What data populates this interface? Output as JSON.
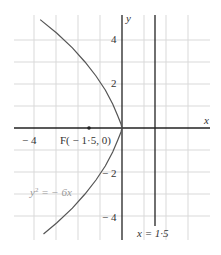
{
  "diagram": {
    "axes": {
      "x_label": "x",
      "y_label": "y",
      "x_ticks": [
        {
          "value": -4,
          "label": "− 4"
        }
      ],
      "y_ticks": [
        {
          "value": 4,
          "label": "4"
        },
        {
          "value": 2,
          "label": "2"
        },
        {
          "value": -2,
          "label": "− 2"
        },
        {
          "value": -4,
          "label": "− 4"
        }
      ]
    },
    "curve": {
      "equation_label": "y² = − 6x",
      "y2": "y",
      "sup": "2",
      "rest": " =  − 6x"
    },
    "focus": {
      "label": "F( − 1·5, 0)",
      "x": -1.5,
      "y": 0
    },
    "directrix": {
      "label": "x  =  1·5",
      "x": 1.5
    },
    "colors": {
      "grid": "#d9d9d9",
      "axis": "#222222",
      "curve": "#555555",
      "text": "#333333"
    }
  }
}
